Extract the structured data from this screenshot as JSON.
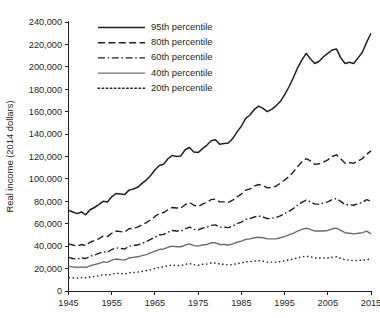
{
  "chart_data": {
    "type": "line",
    "title": "",
    "xlabel": "",
    "ylabel": "Real income (2014 dollars)",
    "xlim": [
      1945,
      2015
    ],
    "ylim": [
      0,
      240000
    ],
    "grid": false,
    "legend_position": "top-center",
    "x_ticks": [
      1945,
      1955,
      1965,
      1975,
      1985,
      1995,
      2005,
      2015
    ],
    "x_tick_labels": [
      "1945",
      "1955",
      "1965",
      "1975",
      "1985",
      "1995",
      "2005",
      "2015"
    ],
    "y_ticks": [
      0,
      20000,
      40000,
      60000,
      80000,
      100000,
      120000,
      140000,
      160000,
      180000,
      200000,
      220000,
      240000
    ],
    "y_tick_labels": [
      "0",
      "20,000",
      "40,000",
      "60,000",
      "80,000",
      "100,000",
      "120,000",
      "140,000",
      "160,000",
      "180,000",
      "200,000",
      "220,000",
      "240,000"
    ],
    "x": [
      1945,
      1946,
      1947,
      1948,
      1949,
      1950,
      1951,
      1952,
      1953,
      1954,
      1955,
      1956,
      1957,
      1958,
      1959,
      1960,
      1961,
      1962,
      1963,
      1964,
      1965,
      1966,
      1967,
      1968,
      1969,
      1970,
      1971,
      1972,
      1973,
      1974,
      1975,
      1976,
      1977,
      1978,
      1979,
      1980,
      1981,
      1982,
      1983,
      1984,
      1985,
      1986,
      1987,
      1988,
      1989,
      1990,
      1991,
      1992,
      1993,
      1994,
      1995,
      1996,
      1997,
      1998,
      1999,
      2000,
      2001,
      2002,
      2003,
      2004,
      2005,
      2006,
      2007,
      2008,
      2009,
      2010,
      2011,
      2012,
      2013,
      2014,
      2015
    ],
    "series": [
      {
        "name": "95th percentile",
        "style": "solid",
        "color": "#231f20",
        "width": 1.5,
        "values": [
          72000,
          70500,
          69000,
          70500,
          68000,
          72500,
          74500,
          77000,
          80000,
          79500,
          84000,
          87000,
          86500,
          86000,
          90000,
          91000,
          92500,
          96000,
          99000,
          103000,
          108000,
          112000,
          113000,
          118000,
          121000,
          120000,
          120500,
          126000,
          128000,
          124000,
          123500,
          127000,
          130000,
          134000,
          135000,
          131000,
          131500,
          132000,
          136000,
          142000,
          147000,
          154000,
          157000,
          162000,
          165000,
          163000,
          160000,
          162000,
          165000,
          169000,
          175000,
          182000,
          190000,
          199000,
          206000,
          212000,
          207000,
          203000,
          205000,
          209000,
          212000,
          215000,
          216000,
          208000,
          203000,
          204000,
          203000,
          208000,
          213000,
          222000,
          230000
        ]
      },
      {
        "name": "80th percentile",
        "style": "dashed",
        "color": "#231f20",
        "width": 1.4,
        "values": [
          42000,
          41000,
          40000,
          41500,
          40500,
          43500,
          45000,
          46500,
          49000,
          48500,
          51500,
          53500,
          53000,
          52500,
          55500,
          56000,
          57000,
          59000,
          61000,
          63500,
          66500,
          69000,
          70000,
          72500,
          74500,
          74000,
          74000,
          77000,
          79000,
          76500,
          75500,
          77500,
          79000,
          81500,
          82000,
          79500,
          79500,
          79000,
          81000,
          84000,
          86500,
          90000,
          91000,
          93500,
          95000,
          94000,
          92000,
          92500,
          93500,
          96000,
          99000,
          102000,
          106000,
          111000,
          115000,
          118000,
          116000,
          113000,
          113500,
          115000,
          117000,
          120000,
          121500,
          118000,
          114000,
          114500,
          114000,
          116000,
          118000,
          122000,
          125000
        ]
      },
      {
        "name": "60th percentile",
        "style": "dashdot",
        "color": "#231f20",
        "width": 1.4,
        "values": [
          30000,
          29000,
          28500,
          29500,
          29000,
          31000,
          32000,
          33500,
          35000,
          34500,
          37000,
          38500,
          38000,
          37500,
          40000,
          40500,
          41000,
          42500,
          44000,
          46000,
          48000,
          50000,
          50500,
          52500,
          54000,
          53500,
          53500,
          55500,
          57000,
          55000,
          54500,
          56000,
          57000,
          58500,
          59000,
          57000,
          57000,
          56500,
          58000,
          60000,
          61500,
          64000,
          64500,
          66000,
          67000,
          66000,
          64500,
          65000,
          65500,
          67000,
          69000,
          71000,
          73500,
          76500,
          79000,
          81000,
          79500,
          77500,
          77500,
          78500,
          79500,
          81500,
          82500,
          80000,
          77000,
          77000,
          76500,
          78000,
          79000,
          81500,
          80000
        ]
      },
      {
        "name": "40th percentile",
        "style": "solid-gray",
        "color": "#6d6e71",
        "width": 1.4,
        "values": [
          22000,
          21500,
          21000,
          21500,
          21000,
          22500,
          23500,
          24500,
          26000,
          25500,
          27500,
          28500,
          28000,
          27500,
          29500,
          30000,
          30500,
          31500,
          32500,
          34000,
          35500,
          37000,
          37500,
          39000,
          40000,
          39500,
          39500,
          41000,
          42000,
          40500,
          40000,
          41000,
          41500,
          43000,
          43000,
          41500,
          41500,
          41000,
          42000,
          43500,
          44500,
          46000,
          46500,
          47500,
          48000,
          47500,
          46500,
          46500,
          46500,
          47500,
          48500,
          50000,
          51500,
          53500,
          55000,
          56000,
          55000,
          53500,
          53500,
          53500,
          54000,
          55500,
          56000,
          54000,
          52000,
          51500,
          51000,
          51500,
          52000,
          53500,
          51000
        ]
      },
      {
        "name": "20th percentile",
        "style": "dotted",
        "color": "#231f20",
        "width": 1.4,
        "values": [
          12000,
          11800,
          11500,
          12000,
          11800,
          12500,
          13000,
          13500,
          14500,
          14200,
          15000,
          15800,
          15500,
          15200,
          16200,
          16500,
          16800,
          17500,
          18200,
          19000,
          20000,
          21000,
          21500,
          22500,
          23000,
          22800,
          22800,
          23800,
          24500,
          23500,
          23000,
          23800,
          24000,
          25000,
          25000,
          24000,
          23800,
          23200,
          23500,
          24500,
          25000,
          26000,
          26200,
          26800,
          27000,
          26500,
          25800,
          25800,
          25800,
          26200,
          27000,
          27800,
          28500,
          29500,
          30500,
          31000,
          30500,
          29500,
          29500,
          29500,
          29500,
          30200,
          30500,
          29000,
          27800,
          27500,
          27000,
          27200,
          27500,
          28200,
          28000
        ]
      }
    ]
  }
}
